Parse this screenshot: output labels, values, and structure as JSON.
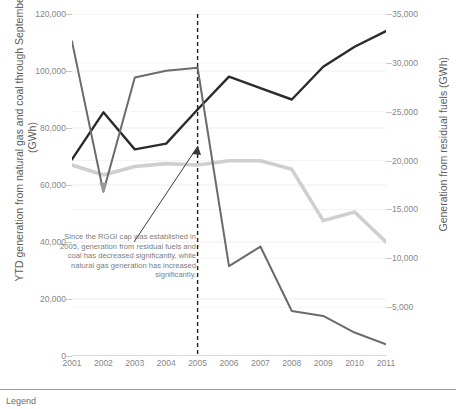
{
  "chart_data": {
    "type": "line",
    "title": "",
    "xlabel": "",
    "ylabel": "YTD generation from natural gas and coal through September (GWh)",
    "y2label": "Generation from residual fuels (GWh)",
    "grid": true,
    "legend_position": "bottom",
    "x": [
      2001,
      2002,
      2003,
      2004,
      2005,
      2006,
      2007,
      2008,
      2009,
      2010,
      2011
    ],
    "xtick_labels": [
      "2001",
      "2002",
      "2003",
      "2004",
      "2005",
      "2006",
      "2007",
      "2008",
      "2009",
      "2010",
      "2011"
    ],
    "ylim": [
      0,
      120000
    ],
    "ytick_labels": [
      "0",
      "20,000",
      "40,000",
      "60,000",
      "80,000",
      "100,000",
      "120,000"
    ],
    "ytick_values": [
      0,
      20000,
      40000,
      60000,
      80000,
      100000,
      120000
    ],
    "y2lim": [
      0,
      35000
    ],
    "y2tick_labels": [
      "5,000",
      "10,000",
      "15,000",
      "20,000",
      "25,000",
      "30,000",
      "35,000"
    ],
    "y2tick_values": [
      5000,
      10000,
      15000,
      20000,
      25000,
      30000,
      35000
    ],
    "series": [
      {
        "name": "natural-gas",
        "axis": "left",
        "color": "#2b2b2b",
        "width": 2.4,
        "values": [
          69000,
          85500,
          72500,
          74500,
          86500,
          98000,
          94000,
          90000,
          101500,
          108500,
          114000
        ]
      },
      {
        "name": "coal",
        "axis": "left",
        "color": "#cfcfcf",
        "width": 3.6,
        "values": [
          67000,
          63500,
          66500,
          67500,
          67000,
          68500,
          68500,
          65500,
          47500,
          50500,
          40000
        ]
      },
      {
        "name": "residual-fuels",
        "axis": "right",
        "color": "#6b6b6b",
        "width": 2.0,
        "values": [
          32200,
          16800,
          28500,
          29200,
          29500,
          9200,
          11200,
          4600,
          4100,
          2400,
          1200
        ]
      }
    ],
    "annotations": [
      {
        "name": "rggi-note",
        "text": "Since the RGGI cap was established in 2005, generation from residual fuels and coal has decreased significantly, while natural gas generation has increased significantly.",
        "arrow": true
      }
    ],
    "reference_line": {
      "name": "rggi-cap-2005",
      "x": 2005,
      "style": "dashed",
      "color": "#1f1f1f"
    }
  },
  "legend": {
    "label": "Legend"
  },
  "colors": {
    "gridline": "#eeeeee",
    "axis": "#b9b9b9",
    "tick_text": "#878787",
    "title_text": "#5c5c5c",
    "annotation_text": "#7d7d7d"
  }
}
